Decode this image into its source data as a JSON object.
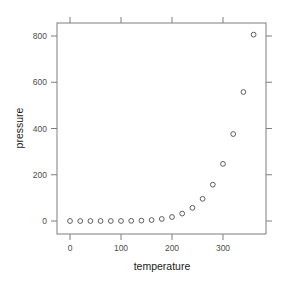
{
  "chart_data": {
    "type": "scatter",
    "title": "",
    "xlabel": "temperature",
    "ylabel": "pressure",
    "xlim": [
      -18,
      378
    ],
    "ylim": [
      -56,
      862
    ],
    "grid": false,
    "legend": null,
    "marker": "open-circle",
    "x_ticks": [
      0,
      100,
      200,
      300
    ],
    "y_ticks": [
      0,
      200,
      400,
      600,
      800
    ],
    "x_tick_labels": [
      "0",
      "100",
      "200",
      "300"
    ],
    "y_tick_labels": [
      "0",
      "200",
      "400",
      "600",
      "800"
    ],
    "x": [
      0,
      20,
      40,
      60,
      80,
      100,
      120,
      140,
      160,
      180,
      200,
      220,
      240,
      260,
      280,
      300,
      320,
      340,
      360
    ],
    "y": [
      0.0002,
      0.0012,
      0.006,
      0.03,
      0.09,
      0.27,
      0.75,
      1.85,
      4.2,
      8.8,
      17.3,
      32.1,
      57.0,
      96.0,
      157.0,
      247.0,
      376.0,
      558.0,
      806.0
    ]
  },
  "colors": {
    "frame": "#7f7f7f",
    "point": "#4d4d4d",
    "text": "#4d4d4d",
    "label": "#1a1a1a"
  }
}
